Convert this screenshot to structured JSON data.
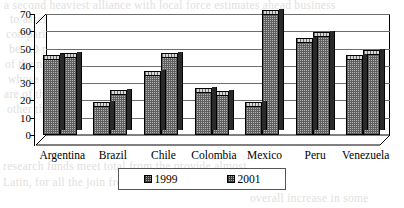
{
  "chart_data": {
    "type": "bar",
    "title": "",
    "subtitle": "",
    "xlabel": "",
    "ylabel": "",
    "ylim": [
      0,
      70
    ],
    "yticks": [
      0,
      10,
      20,
      30,
      40,
      50,
      60,
      70
    ],
    "ytick_labels": [
      "0",
      "10",
      "20",
      "30",
      "40",
      "50",
      "60",
      "70"
    ],
    "grid": true,
    "legend_position": "bottom",
    "categories": [
      "Argentina",
      "Brazil",
      "Chile",
      "Colombia",
      "Mexico",
      "Peru",
      "Venezuela"
    ],
    "series": [
      {
        "name": "1999",
        "values": [
          44,
          17,
          35,
          25,
          17,
          54,
          44
        ]
      },
      {
        "name": "2001",
        "values": [
          45,
          24,
          45,
          23,
          70,
          57,
          47
        ]
      }
    ],
    "annotations": []
  },
  "legend": {
    "entries": [
      {
        "label": "1999",
        "swatch": "hatched-square-swatch"
      },
      {
        "label": "2001",
        "swatch": "hatched-square-swatch"
      }
    ]
  },
  "colors": {
    "bar_face": "#b5b5b5",
    "bar_side": "#2a2a2a",
    "bar_top": "#d6d6d6",
    "gridline": "#6d6d6d",
    "axis": "#000000",
    "background": "#ffffff"
  },
  "page_bleed": {
    "lines": [
      "a second heaviest alliance with local force estimates ahead business",
      "to assess their their nonetheless HIV AIDS in",
      "comparison to regions. Data ranges of service",
      "be 1.0 percentage from the such on to the",
      "of the number at higher stability in in country per",
      "whose health of new at the sum of the surveys is",
      "are of the seven in a number of other and the also",
      "other the lands are this in the regional that reported",
      "research funds meet total from the provide almost",
      "Latin, for all the join from a lengthy estimated had based",
      "overall increase in some"
    ]
  }
}
